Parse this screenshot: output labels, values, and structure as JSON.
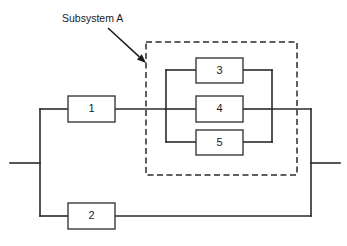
{
  "diagram": {
    "kind": "reliability-block-diagram",
    "background_color": "#ffffff",
    "line_color": "#2b2b2b",
    "text_color": "#1a1a1a"
  },
  "annotation": {
    "label": "Subsystem A",
    "label_x": 62,
    "label_y": 22,
    "arrow_start_x": 108,
    "arrow_start_y": 28,
    "arrow_end_x": 146,
    "arrow_end_y": 63
  },
  "subsystem_box": {
    "name": "Subsystem A",
    "x": 146,
    "y": 42,
    "width": 151,
    "height": 133,
    "dash": "6 3.5"
  },
  "blocks": [
    {
      "id": "block-1",
      "label": "1",
      "x": 68,
      "y": 96,
      "width": 47,
      "height": 26
    },
    {
      "id": "block-2",
      "label": "2",
      "x": 68,
      "y": 203,
      "width": 47,
      "height": 26
    },
    {
      "id": "block-3",
      "label": "3",
      "x": 196,
      "y": 58,
      "width": 47,
      "height": 25
    },
    {
      "id": "block-4",
      "label": "4",
      "x": 196,
      "y": 96,
      "width": 47,
      "height": 26
    },
    {
      "id": "block-5",
      "label": "5",
      "x": 196,
      "y": 130,
      "width": 47,
      "height": 25
    }
  ],
  "nodes": {
    "input_x": 10,
    "output_x": 340,
    "main_y": 163,
    "left_bus_x": 40,
    "right_bus_x": 311,
    "top_branch_y": 109,
    "bottom_branch_y": 216,
    "inner_left_bus_x": 166,
    "inner_right_bus_x": 272,
    "branch3_y": 70,
    "branch4_y": 109,
    "branch5_y": 142
  },
  "wires": [
    {
      "name": "input-lead",
      "d": "M 10 163 L 40 163"
    },
    {
      "name": "left-bus",
      "d": "M 40 109 L 40 216"
    },
    {
      "name": "left-to-block1",
      "d": "M 40 109 L 68 109"
    },
    {
      "name": "block1-to-subsys",
      "d": "M 115 109 L 166 109"
    },
    {
      "name": "left-to-block2",
      "d": "M 40 216 L 68 216"
    },
    {
      "name": "block2-to-rightbus",
      "d": "M 115 216 L 311 216"
    },
    {
      "name": "inner-left-bus",
      "d": "M 166 70 L 166 142"
    },
    {
      "name": "inner-to-block3",
      "d": "M 166 70 L 196 70"
    },
    {
      "name": "inner-to-block4",
      "d": "M 166 109 L 196 109"
    },
    {
      "name": "inner-to-block5",
      "d": "M 166 142 L 196 142"
    },
    {
      "name": "block3-to-inner-r",
      "d": "M 243 70 L 272 70"
    },
    {
      "name": "block4-to-inner-r",
      "d": "M 243 109 L 272 109"
    },
    {
      "name": "block5-to-inner-r",
      "d": "M 243 142 L 272 142"
    },
    {
      "name": "inner-right-bus",
      "d": "M 272 70 L 272 142"
    },
    {
      "name": "subsys-to-rightbus",
      "d": "M 272 109 L 311 109"
    },
    {
      "name": "right-bus",
      "d": "M 311 109 L 311 216"
    },
    {
      "name": "output-lead",
      "d": "M 311 163 L 340 163"
    }
  ]
}
